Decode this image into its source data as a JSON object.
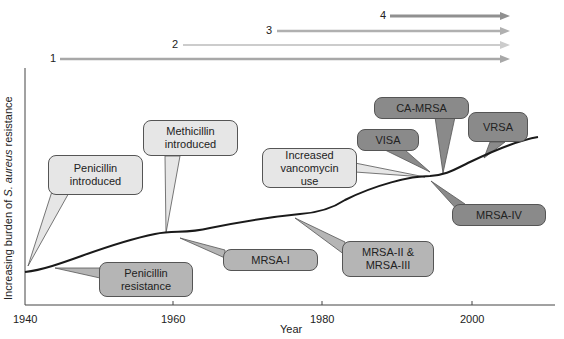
{
  "title_arrows": [
    {
      "label": "1",
      "start_year": 1945,
      "color": "#a8a8a8"
    },
    {
      "label": "2",
      "start_year": 1960,
      "color": "#c8c8c8"
    },
    {
      "label": "3",
      "start_year": 1975,
      "color": "#b0b0b0"
    },
    {
      "label": "4",
      "start_year": 1990,
      "color": "#909090"
    }
  ],
  "axes": {
    "ylabel_prefix": "Increasing burden of ",
    "ylabel_italic": "S. aureus",
    "ylabel_suffix": " resistance",
    "xlabel": "Year",
    "xticks": [
      "1940",
      "1960",
      "1980",
      "2000"
    ]
  },
  "callouts": {
    "penicillin_introduced": "Penicillin introduced",
    "penicillin_resistance": "Penicillin resistance",
    "methicillin_introduced": "Methicillin introduced",
    "mrsa_1": "MRSA-I",
    "mrsa_2_3": "MRSA-II & MRSA-III",
    "increased_vancomycin": "Increased vancomycin use",
    "visa": "VISA",
    "ca_mrsa": "CA-MRSA",
    "vrsa": "VRSA",
    "mrsa_4": "MRSA-IV"
  },
  "colors": {
    "light_box": "#e6e6e6",
    "mid_box": "#b5b5b5",
    "dark_box": "#8a8a8a",
    "curve": "#1a1a1a"
  }
}
